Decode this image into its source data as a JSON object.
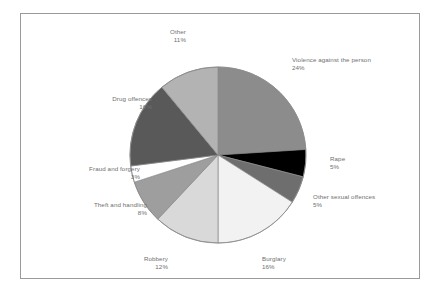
{
  "chart_data": {
    "type": "pie",
    "title": "",
    "subtitle": "",
    "xlabel": "",
    "ylabel": "",
    "legend_position": "none",
    "grid": false,
    "start_angle_deg": 90,
    "direction": "clockwise",
    "units": "percent",
    "total": 100,
    "categories": [
      "Violence against the person",
      "Rape",
      "Other sexual offences",
      "Burglary",
      "Robbery",
      "Theft and handling",
      "Fraud and forgery",
      "Drug offences",
      "Other"
    ],
    "values": [
      24,
      5,
      5,
      16,
      12,
      8,
      3,
      16,
      11
    ],
    "value_labels": [
      "24%",
      "5%",
      "5%",
      "16%",
      "12%",
      "8%",
      "3%",
      "16%",
      "11%"
    ],
    "colors": [
      "#8c8c8c",
      "#000000",
      "#6e6e6e",
      "#f2f2f2",
      "#d9d9d9",
      "#9e9e9e",
      "#ffffff",
      "#595959",
      "#b3b3b3"
    ],
    "slices": [
      {
        "label": "Violence against the person",
        "value": 24,
        "value_label": "24%",
        "color": "#8c8c8c",
        "align": "right"
      },
      {
        "label": "Rape",
        "value": 5,
        "value_label": "5%",
        "color": "#000000",
        "align": "right"
      },
      {
        "label": "Other sexual offences",
        "value": 5,
        "value_label": "5%",
        "color": "#6e6e6e",
        "align": "right"
      },
      {
        "label": "Burglary",
        "value": 16,
        "value_label": "16%",
        "color": "#f2f2f2",
        "align": "center"
      },
      {
        "label": "Robbery",
        "value": 12,
        "value_label": "12%",
        "color": "#d9d9d9",
        "align": "center"
      },
      {
        "label": "Theft and handling",
        "value": 8,
        "value_label": "8%",
        "color": "#9e9e9e",
        "align": "left"
      },
      {
        "label": "Fraud and forgery",
        "value": 3,
        "value_label": "3%",
        "color": "#ffffff",
        "align": "left"
      },
      {
        "label": "Drug offences",
        "value": 16,
        "value_label": "16%",
        "color": "#595959",
        "align": "left"
      },
      {
        "label": "Other",
        "value": 11,
        "value_label": "11%",
        "color": "#b3b3b3",
        "align": "center"
      }
    ]
  },
  "figure": {
    "background_color": "#ffffff",
    "border_color": "#9a9a9a",
    "label_text_color": "#6f6f6f",
    "slice_edge_color": "#8a8a8a"
  },
  "geometry": {
    "center_x": 218,
    "center_y": 155,
    "radius": 88
  },
  "labels": [
    {
      "name": "violence-against-the-person",
      "text": "Violence against the person",
      "pct": "24%",
      "x": 292,
      "y": 56,
      "align": "lbl-right"
    },
    {
      "name": "rape",
      "text": "Rape",
      "pct": "5%",
      "x": 330,
      "y": 155,
      "align": "lbl-right"
    },
    {
      "name": "other-sexual-offences",
      "text": "Other sexual offences",
      "pct": "5%",
      "x": 313,
      "y": 193,
      "align": "lbl-right"
    },
    {
      "name": "burglary",
      "text": "Burglary",
      "pct": "16%",
      "x": 262,
      "y": 255,
      "align": "lbl-right"
    },
    {
      "name": "robbery",
      "text": "Robbery",
      "pct": "12%",
      "x": 168,
      "y": 255,
      "align": "lbl-left"
    },
    {
      "name": "theft-and-handling",
      "text": "Theft and handling",
      "pct": "8%",
      "x": 147,
      "y": 201,
      "align": "lbl-left"
    },
    {
      "name": "fraud-and-forgery",
      "text": "Fraud and forgery",
      "pct": "3%",
      "x": 140,
      "y": 165,
      "align": "lbl-left"
    },
    {
      "name": "drug-offences",
      "text": "Drug offences",
      "pct": "16%",
      "x": 152,
      "y": 95,
      "align": "lbl-left"
    },
    {
      "name": "other",
      "text": "Other",
      "pct": "11%",
      "x": 186,
      "y": 28,
      "align": "lbl-left"
    }
  ]
}
